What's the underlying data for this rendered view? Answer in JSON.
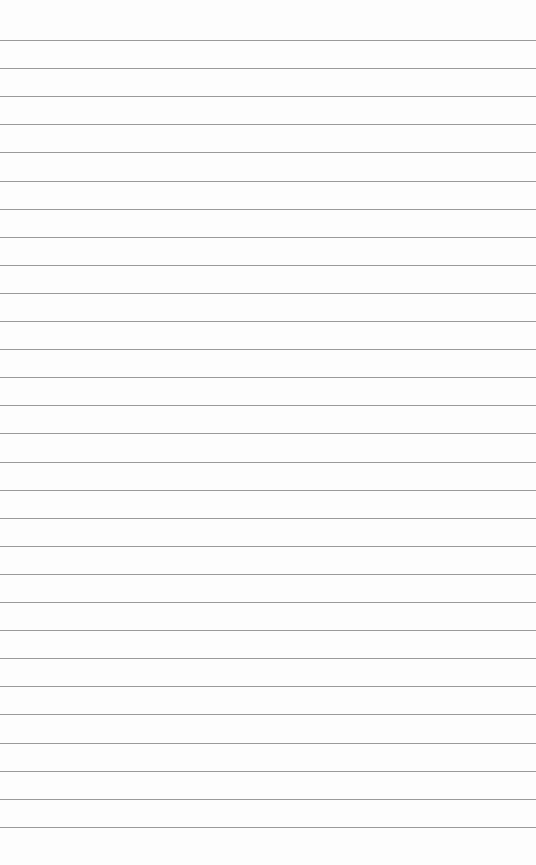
{
  "paper": {
    "type": "lined-paper",
    "background": "#fdfdfd",
    "line_color": "#9a9a9a",
    "first_line_y": 40,
    "line_spacing": 28.1,
    "line_count": 29
  }
}
